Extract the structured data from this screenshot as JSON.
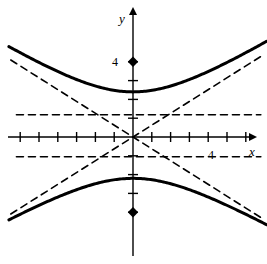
{
  "figure": {
    "title": "",
    "width": 267,
    "height": 264,
    "background": "#ffffff",
    "ink_color": "#000000"
  },
  "labels": {
    "x_axis": "x",
    "y_axis": "y",
    "y_tick_4": "4",
    "x_tick_4": "4"
  },
  "chart_data": {
    "type": "line",
    "title": "",
    "xlabel": "x",
    "ylabel": "y",
    "grid": false,
    "legend": false,
    "axis": {
      "origin_px": [
        133,
        137
      ],
      "unit_px": 18.8,
      "xlim": [
        -6.6,
        7.1
      ],
      "ylim": [
        -6.8,
        7.3
      ],
      "x_ticks": [
        -6,
        -5,
        -4,
        -3,
        -2,
        -1,
        1,
        2,
        3,
        4,
        5,
        6
      ],
      "y_ticks": [
        -4,
        -3,
        -2,
        -1,
        1,
        2,
        3,
        4
      ],
      "x_tick_labels": [
        {
          "value": 4,
          "text": "4"
        }
      ],
      "y_tick_labels": [
        {
          "value": 4,
          "text": "4"
        }
      ],
      "arrows": [
        "x-positive",
        "y-positive"
      ]
    },
    "curves": [
      {
        "name": "hyperbola-upper-branch",
        "style": "solid",
        "width": 3,
        "color": "#000000",
        "equation": "y = +a*sqrt(1 + x^2/b^2)",
        "a": 2.4,
        "b": 3.8,
        "vertex": [
          0,
          2.4
        ],
        "x_range": [
          -6.6,
          7.1
        ]
      },
      {
        "name": "hyperbola-lower-branch",
        "style": "solid",
        "width": 3,
        "color": "#000000",
        "equation": "y = -a*sqrt(1 + x^2/b^2)",
        "a": 2.2,
        "b": 3.8,
        "vertex": [
          0,
          -2.2
        ],
        "x_range": [
          -6.6,
          7.1
        ]
      },
      {
        "name": "asymptote-positive-slope",
        "style": "dashed",
        "width": 1.6,
        "color": "#000000",
        "equation": "y = 0.63x",
        "slope": 0.63,
        "x_range": [
          -6.5,
          6.9
        ]
      },
      {
        "name": "asymptote-negative-slope",
        "style": "dashed",
        "width": 1.6,
        "color": "#000000",
        "equation": "y = -0.63x",
        "slope": -0.63,
        "x_range": [
          -6.5,
          6.9
        ]
      },
      {
        "name": "horizontal-dashed-upper",
        "style": "dashed",
        "width": 1.6,
        "color": "#000000",
        "equation": "y = 1.18",
        "y": 1.18,
        "x_range": [
          -6.2,
          6.8
        ]
      },
      {
        "name": "horizontal-dashed-lower",
        "style": "dashed",
        "width": 1.6,
        "color": "#000000",
        "equation": "y = -1.05",
        "y": -1.05,
        "x_range": [
          -6.2,
          6.8
        ]
      }
    ],
    "points": [
      {
        "name": "focus-upper",
        "marker": "diamond",
        "x": 0,
        "y": 4,
        "label": "4",
        "color": "#000000"
      },
      {
        "name": "focus-lower",
        "marker": "diamond",
        "x": 0,
        "y": -4,
        "label": "",
        "color": "#000000"
      }
    ]
  }
}
